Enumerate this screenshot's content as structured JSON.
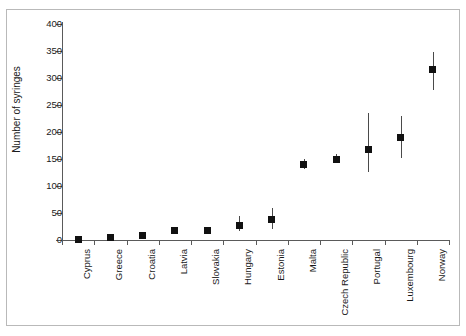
{
  "chart_data": {
    "type": "scatter",
    "title": "",
    "xlabel": "",
    "ylabel": "Number of syringes",
    "ylim": [
      0,
      400
    ],
    "yticks": [
      0,
      50,
      100,
      150,
      200,
      250,
      300,
      350,
      400
    ],
    "ytick_labels": [
      "0",
      "50",
      "100",
      "150",
      "200",
      "250",
      "300",
      "350",
      "400"
    ],
    "grid": false,
    "legend": "none",
    "error_bars": "vertical",
    "categories": [
      "Cyprus",
      "Greece",
      "Croatia",
      "Latvia",
      "Slovakia",
      "Hungary",
      "Estonia",
      "Malta",
      "Czech Republic",
      "Portugal",
      "Luxembourg",
      "Norway"
    ],
    "values": [
      1,
      4,
      9,
      17,
      18,
      27,
      38,
      140,
      150,
      167,
      190,
      315
    ],
    "error_low": [
      0,
      2,
      6,
      12,
      13,
      17,
      20,
      131,
      143,
      126,
      152,
      278
    ],
    "error_high": [
      3,
      7,
      13,
      24,
      25,
      44,
      59,
      150,
      159,
      235,
      229,
      348
    ],
    "marker": "filled-square",
    "marker_color": "#111111",
    "error_color": "#4a4a4a",
    "axis_color": "#5a5a5a",
    "background": "#ffffff"
  }
}
